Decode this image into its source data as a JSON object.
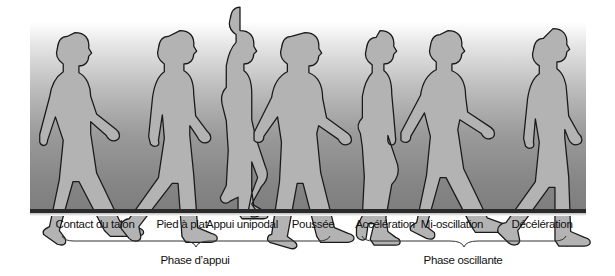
{
  "figure": {
    "colors": {
      "body_fill": "#b3b3b3",
      "outline": "#1a1a1a",
      "ground": "#2a2a2a",
      "gradient_top": "#ffffff",
      "gradient_bottom": "#7e7e7e"
    },
    "stages": [
      {
        "label": "Contact du talon",
        "x": 95
      },
      {
        "label": "Pied à plat",
        "x": 182
      },
      {
        "label": "Appui unipodal",
        "x": 242
      },
      {
        "label": "Poussée",
        "x": 313
      },
      {
        "label": "Accélération",
        "x": 385
      },
      {
        "label": "Mi-oscillation",
        "x": 452
      },
      {
        "label": "Décélération",
        "x": 542
      }
    ],
    "phases": [
      {
        "label": "Phase d’appui",
        "x": 195,
        "from": 62,
        "to": 330
      },
      {
        "label": "Phase oscillante",
        "x": 463,
        "from": 362,
        "to": 566
      }
    ]
  }
}
